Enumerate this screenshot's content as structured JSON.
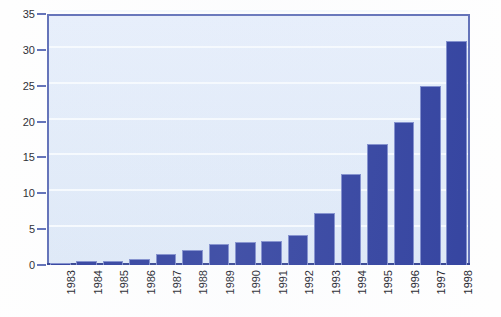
{
  "chart_data": {
    "type": "bar",
    "title": "",
    "subtitle": "",
    "xlabel": "",
    "ylabel": "",
    "categories": [
      "1983",
      "1984",
      "1985",
      "1986",
      "1987",
      "1988",
      "1989",
      "1990",
      "1991",
      "1992",
      "1993",
      "1994",
      "1995",
      "1996",
      "1997",
      "1998"
    ],
    "values": [
      0.3,
      0.5,
      0.6,
      0.8,
      1.5,
      2.1,
      3.0,
      3.2,
      3.4,
      4.2,
      7.3,
      12.7,
      16.9,
      20.0,
      24.9,
      31.3
    ],
    "series": [
      {
        "name": "",
        "values": [
          0.3,
          0.5,
          0.6,
          0.8,
          1.5,
          2.1,
          3.0,
          3.2,
          3.4,
          4.2,
          7.3,
          12.7,
          16.9,
          20.0,
          24.9,
          31.3
        ]
      }
    ],
    "ylim": [
      0,
      35
    ],
    "yticks": [
      0,
      5,
      10,
      15,
      20,
      25,
      30,
      35
    ],
    "ytick_labels": [
      "0",
      "5",
      "10",
      "15",
      "20",
      "25",
      "30",
      "35"
    ],
    "grid": true,
    "grid_axis": "y",
    "legend": false,
    "legend_position": "none",
    "annotations": [],
    "colors": {
      "bar_fill": "#2c3c9c",
      "bar_edge": "#7c8acb",
      "plot_background": "#e3ecf9",
      "plot_border": "#5b6bb5",
      "gridline": "#f6fafe",
      "axis_line": "#2e3e8f",
      "tick_label": "#17171f",
      "figure_background": "#fefefe"
    }
  }
}
